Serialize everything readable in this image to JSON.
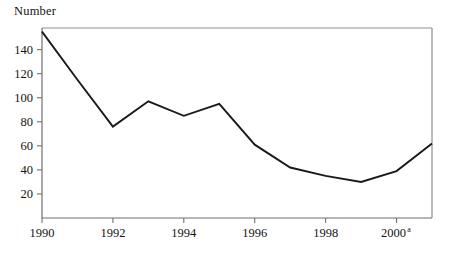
{
  "chart_data": {
    "type": "line",
    "title": "Number",
    "ylabel": "Number",
    "xlabel": "",
    "x": [
      1990,
      1991,
      1992,
      1993,
      1994,
      1995,
      1996,
      1997,
      1998,
      1999,
      2000,
      2001
    ],
    "values": [
      155,
      115,
      76,
      97,
      85,
      95,
      61,
      42,
      35,
      30,
      39,
      62
    ],
    "series": [
      {
        "name": "Number",
        "values": [
          155,
          115,
          76,
          97,
          85,
          95,
          61,
          42,
          35,
          30,
          39,
          62
        ]
      }
    ],
    "categories": [
      "1990",
      "1991",
      "1992",
      "1993",
      "1994",
      "1995",
      "1996",
      "1997",
      "1998",
      "1999",
      "2000",
      "2001"
    ],
    "x_tick_labels": [
      "1990",
      "1992",
      "1994",
      "1996",
      "1998",
      "2000"
    ],
    "x_tick_values": [
      1990,
      1992,
      1994,
      1996,
      1998,
      2000
    ],
    "x_tick_superscripts": [
      "",
      "",
      "",
      "",
      "",
      "a"
    ],
    "y_tick_labels": [
      "20",
      "40",
      "60",
      "80",
      "100",
      "120",
      "140"
    ],
    "y_tick_values": [
      20,
      40,
      60,
      80,
      100,
      120,
      140
    ],
    "xlim": [
      1990,
      2001
    ],
    "ylim": [
      0,
      158
    ],
    "grid": false,
    "legend": false,
    "line_color": "#1a1a1a",
    "axis_color": "#8a8a8a",
    "background": "#ffffff",
    "footnote_marker": "a"
  },
  "labels": {
    "y_axis_caption": "Number"
  }
}
